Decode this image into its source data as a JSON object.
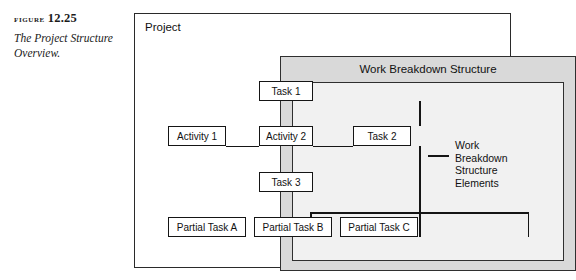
{
  "caption": {
    "figure_word": "Figure",
    "figure_number": "12.25",
    "text": "The Project Structure Overview."
  },
  "diagram": {
    "outer_label": "Project",
    "middle_label": "Work Breakdown Structure",
    "callout": {
      "line1": "Work",
      "line2": "Breakdown",
      "line3": "Structure",
      "line4": "Elements"
    },
    "nodes": {
      "task1": "Task 1",
      "activity1": "Activity 1",
      "activity2": "Activity 2",
      "task2": "Task 2",
      "task3": "Task 3",
      "partial_a": "Partial Task A",
      "partial_b": "Partial Task B",
      "partial_c": "Partial Task C"
    }
  },
  "colors": {
    "page_background": "#ffffff",
    "frame_border": "#2a2a2a",
    "wbs_fill": "#d9d9d9",
    "inner_fill": "#f1f1f1",
    "node_fill": "#ffffff",
    "node_border": "#151515",
    "text": "#111111"
  }
}
